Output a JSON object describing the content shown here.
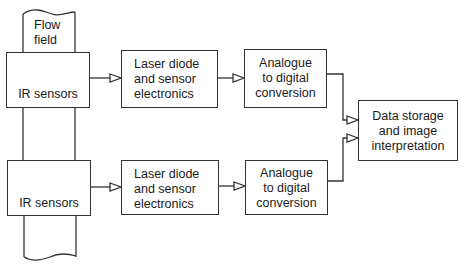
{
  "diagram": {
    "pipe_label": "Flow\nfield",
    "channels": [
      {
        "sensor": "IR sensors",
        "laser": "Laser diode\nand sensor\nelectronics",
        "adc": "Analogue\nto digital\nconversion"
      },
      {
        "sensor": "IR sensors",
        "laser": "Laser diode\nand sensor\nelectronics",
        "adc": "Analogue\nto digital\nconversion"
      }
    ],
    "output": "Data storage\nand image\ninterpretation",
    "colors": {
      "line": "#333333",
      "background": "#ffffff"
    }
  }
}
